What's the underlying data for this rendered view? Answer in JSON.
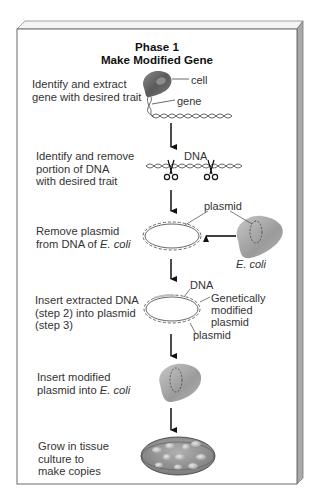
{
  "panel": {
    "title_line1": "Phase 1",
    "title_line2": "Make Modified Gene"
  },
  "steps": [
    {
      "id": 1,
      "text": "Identify and extract\ngene with desired trait",
      "labels": {
        "cell": "cell",
        "gene": "gene"
      }
    },
    {
      "id": 2,
      "text": "Identify and remove\nportion of DNA\nwith desired trait",
      "labels": {
        "dna": "DNA"
      }
    },
    {
      "id": 3,
      "text_prefix": "Remove plasmid\nfrom DNA of ",
      "text_italic": "E. coli",
      "labels": {
        "plasmid": "plasmid",
        "ecoli": "E. coli"
      }
    },
    {
      "id": 4,
      "text": "Insert extracted DNA\n(step 2) into plasmid\n(step 3)",
      "labels": {
        "dna": "DNA",
        "gm_plasmid": "Genetically\nmodified\nplasmid",
        "plasmid": "plasmid"
      }
    },
    {
      "id": 5,
      "text_prefix": "Insert modified\nplasmid into ",
      "text_italic": "E. coli"
    },
    {
      "id": 6,
      "text": "Grow in tissue\nculture to\nmake copies"
    }
  ],
  "colors": {
    "panel_face": "#ffffff",
    "panel_border": "#6a6a6a",
    "panel_side": "#a9a9a9",
    "panel_top": "#f4f4f4",
    "cell_dark": "#6a6a6a",
    "cell_light": "#b8b8b8",
    "arrow": "#111111",
    "dna_strand": "#555555"
  }
}
